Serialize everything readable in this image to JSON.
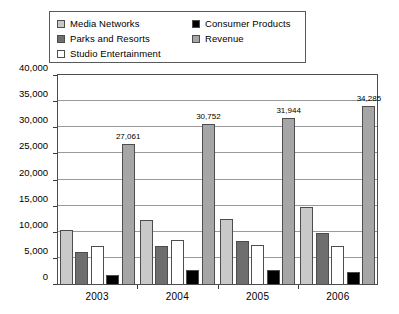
{
  "legend": {
    "items": [
      {
        "label": "Media Networks",
        "color": "#c9c9c9",
        "column": "a"
      },
      {
        "label": "Consumer Products",
        "color": "#000000",
        "column": "b"
      },
      {
        "label": "Parks and Resorts",
        "color": "#6e6e6e",
        "column": "a"
      },
      {
        "label": "Revenue",
        "color": "#a6a6a6",
        "column": "b"
      },
      {
        "label": "Studio Entertainment",
        "color": "#ffffff",
        "column": "a"
      }
    ]
  },
  "axes": {
    "y_ticks": [
      "0",
      "5,000",
      "10,000",
      "15,000",
      "20,000",
      "25,000",
      "30,000",
      "35,000",
      "40,000"
    ],
    "x_ticks": [
      "2003",
      "2004",
      "2005",
      "2006"
    ]
  },
  "chart_data": {
    "type": "bar",
    "title": "",
    "xlabel": "",
    "ylabel": "",
    "ylim": [
      0,
      40000
    ],
    "ystep": 5000,
    "grid": true,
    "legend_position": "top",
    "categories": [
      "2003",
      "2004",
      "2005",
      "2006"
    ],
    "series": [
      {
        "name": "Media Networks",
        "color": "#c9c9c9",
        "values": [
          10600,
          12500,
          12600,
          15000
        ],
        "labels": [
          "",
          "",
          "",
          ""
        ]
      },
      {
        "name": "Parks and Resorts",
        "color": "#6e6e6e",
        "values": [
          6400,
          7400,
          8500,
          9900
        ],
        "labels": [
          "",
          "",
          "",
          ""
        ]
      },
      {
        "name": "Studio Entertainment",
        "color": "#ffffff",
        "values": [
          7400,
          8700,
          7600,
          7500
        ],
        "labels": [
          "",
          "",
          "",
          ""
        ]
      },
      {
        "name": "Consumer Products",
        "color": "#000000",
        "values": [
          2000,
          2900,
          2900,
          2400
        ],
        "labels": [
          "",
          "",
          "",
          ""
        ]
      },
      {
        "name": "Revenue",
        "color": "#a6a6a6",
        "values": [
          27061,
          30752,
          31944,
          34285
        ],
        "labels": [
          "27,061",
          "30,752",
          "31,944",
          "34,285"
        ]
      }
    ]
  }
}
